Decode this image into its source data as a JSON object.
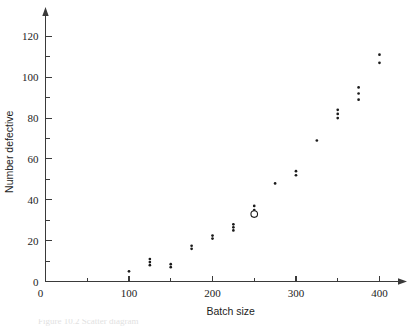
{
  "figure": {
    "caption_partial": "Figure 10.2  Scatter diagram"
  },
  "axes": {
    "x_title": "Batch size",
    "y_title": "Number defective",
    "x_ticks": [
      "0",
      "100",
      "200",
      "300",
      "400"
    ],
    "y_ticks": [
      "0",
      "20",
      "40",
      "60",
      "80",
      "100",
      "120"
    ]
  },
  "colors": {
    "axis": "#3a3a3a",
    "marker": "#1b1b1b",
    "background": "#ffffff"
  },
  "chart_data": {
    "type": "scatter",
    "title": "",
    "xlabel": "Batch size",
    "ylabel": "Number defective",
    "xlim": [
      0,
      415
    ],
    "ylim": [
      0,
      127
    ],
    "grid": false,
    "legend": "none",
    "x_ticks_major": [
      0,
      100,
      200,
      300,
      400
    ],
    "x_ticks_minor": [
      50,
      150,
      250,
      350
    ],
    "y_ticks_major": [
      0,
      20,
      40,
      60,
      80,
      100,
      120
    ],
    "y_ticks_minor": [
      10,
      30,
      50,
      70,
      90,
      110
    ],
    "series": [
      {
        "name": "observations",
        "marker": "filled-dot",
        "points": [
          [
            100,
            5
          ],
          [
            125,
            8
          ],
          [
            125,
            9.5
          ],
          [
            125,
            11
          ],
          [
            150,
            7
          ],
          [
            150,
            8.5
          ],
          [
            175,
            16
          ],
          [
            175,
            17.5
          ],
          [
            200,
            21
          ],
          [
            200,
            22.5
          ],
          [
            225,
            25
          ],
          [
            225,
            26.5
          ],
          [
            225,
            28
          ],
          [
            250,
            35
          ],
          [
            250,
            37
          ],
          [
            275,
            48
          ],
          [
            300,
            52
          ],
          [
            300,
            54
          ],
          [
            325,
            69
          ],
          [
            350,
            80
          ],
          [
            350,
            82
          ],
          [
            350,
            84
          ],
          [
            375,
            89
          ],
          [
            375,
            92
          ],
          [
            375,
            95
          ],
          [
            400,
            107
          ],
          [
            400,
            111
          ]
        ]
      },
      {
        "name": "highlighted-observation",
        "marker": "open-circle",
        "points": [
          [
            250,
            33
          ]
        ]
      }
    ]
  }
}
